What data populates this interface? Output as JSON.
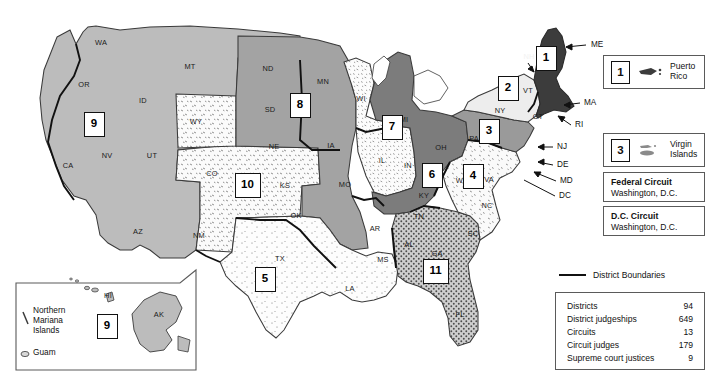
{
  "map": {
    "title": "United States Federal Judicial Circuits",
    "background_color": "#ffffff",
    "boundary_key": {
      "label": "District Boundaries",
      "line_color": "#111111"
    },
    "circuit_badges": [
      {
        "number": "1",
        "x": 546,
        "y": 58
      },
      {
        "number": "2",
        "x": 508,
        "y": 88
      },
      {
        "number": "3",
        "x": 489,
        "y": 131
      },
      {
        "number": "4",
        "x": 473,
        "y": 176
      },
      {
        "number": "5",
        "x": 265,
        "y": 279
      },
      {
        "number": "6",
        "x": 432,
        "y": 175
      },
      {
        "number": "7",
        "x": 392,
        "y": 127
      },
      {
        "number": "8",
        "x": 300,
        "y": 105
      },
      {
        "number": "9",
        "x": 94,
        "y": 124
      },
      {
        "number": "10",
        "x": 245,
        "y": 185
      },
      {
        "number": "11",
        "x": 433,
        "y": 271
      },
      {
        "number": "9",
        "x": 107,
        "y": 326
      }
    ],
    "state_labels": [
      {
        "abbr": "WA",
        "x": 101,
        "y": 43
      },
      {
        "abbr": "OR",
        "x": 84,
        "y": 85
      },
      {
        "abbr": "CA",
        "x": 68,
        "y": 166
      },
      {
        "abbr": "NV",
        "x": 107,
        "y": 156
      },
      {
        "abbr": "ID",
        "x": 143,
        "y": 101
      },
      {
        "abbr": "MT",
        "x": 190,
        "y": 67
      },
      {
        "abbr": "WY",
        "x": 196,
        "y": 122
      },
      {
        "abbr": "UT",
        "x": 152,
        "y": 156
      },
      {
        "abbr": "AZ",
        "x": 138,
        "y": 232
      },
      {
        "abbr": "CO",
        "x": 212,
        "y": 174
      },
      {
        "abbr": "NM",
        "x": 199,
        "y": 236
      },
      {
        "abbr": "ND",
        "x": 268,
        "y": 69
      },
      {
        "abbr": "SD",
        "x": 270,
        "y": 110
      },
      {
        "abbr": "NE",
        "x": 274,
        "y": 147
      },
      {
        "abbr": "KS",
        "x": 285,
        "y": 186
      },
      {
        "abbr": "OK",
        "x": 296,
        "y": 216
      },
      {
        "abbr": "TX",
        "x": 280,
        "y": 259
      },
      {
        "abbr": "MN",
        "x": 323,
        "y": 82
      },
      {
        "abbr": "IA",
        "x": 331,
        "y": 146
      },
      {
        "abbr": "MO",
        "x": 345,
        "y": 185
      },
      {
        "abbr": "AR",
        "x": 375,
        "y": 229
      },
      {
        "abbr": "LA",
        "x": 350,
        "y": 289
      },
      {
        "abbr": "MS",
        "x": 383,
        "y": 260
      },
      {
        "abbr": "WI",
        "x": 361,
        "y": 99
      },
      {
        "abbr": "IL",
        "x": 382,
        "y": 161
      },
      {
        "abbr": "IN",
        "x": 408,
        "y": 166
      },
      {
        "abbr": "MI",
        "x": 404,
        "y": 120
      },
      {
        "abbr": "OH",
        "x": 441,
        "y": 148
      },
      {
        "abbr": "KY",
        "x": 424,
        "y": 196
      },
      {
        "abbr": "TN",
        "x": 419,
        "y": 217
      },
      {
        "abbr": "AL",
        "x": 409,
        "y": 245
      },
      {
        "abbr": "GA",
        "x": 437,
        "y": 254
      },
      {
        "abbr": "FL",
        "x": 460,
        "y": 315
      },
      {
        "abbr": "SC",
        "x": 473,
        "y": 234
      },
      {
        "abbr": "NC",
        "x": 487,
        "y": 206
      },
      {
        "abbr": "VA",
        "x": 489,
        "y": 180
      },
      {
        "abbr": "WV",
        "x": 462,
        "y": 181
      },
      {
        "abbr": "PA",
        "x": 474,
        "y": 139
      },
      {
        "abbr": "NY",
        "x": 500,
        "y": 111
      },
      {
        "abbr": "VT",
        "x": 528,
        "y": 91
      },
      {
        "abbr": "NH",
        "x": 529,
        "y": 57
      },
      {
        "abbr": "CT",
        "x": 538,
        "y": 117
      }
    ],
    "pointer_labels": [
      {
        "abbr": "ME",
        "x": 591,
        "y": 45
      },
      {
        "abbr": "MA",
        "x": 584,
        "y": 103
      },
      {
        "abbr": "RI",
        "x": 575,
        "y": 125
      },
      {
        "abbr": "NJ",
        "x": 557,
        "y": 147
      },
      {
        "abbr": "DE",
        "x": 557,
        "y": 165
      },
      {
        "abbr": "MD",
        "x": 560,
        "y": 181
      },
      {
        "abbr": "DC",
        "x": 559,
        "y": 196
      }
    ],
    "circuit_fills": {
      "circuit_1": "#3c3c3c",
      "circuit_2": "#eaeaea",
      "circuit_3": "#9a9a9a",
      "circuit_4": "#f0f0f0",
      "circuit_5": "#f7f7f7",
      "circuit_6": "#7c7c7c",
      "circuit_7": "#ededed",
      "circuit_8": "#a3a3a3",
      "circuit_9": "#bcbcbc",
      "circuit_10": "#f4f4f4",
      "circuit_11": "#b0b0b0",
      "outline": "#3a3a3a"
    }
  },
  "inset": {
    "labels": [
      {
        "text": "HI",
        "x": 108,
        "y": 296
      },
      {
        "text": "AK",
        "x": 159,
        "y": 315
      }
    ],
    "territories": [
      {
        "name": "Northern\nMariana\nIslands",
        "x": 37,
        "y": 317
      },
      {
        "name": "Guam",
        "x": 37,
        "y": 355
      }
    ]
  },
  "territory_legends": [
    {
      "number": "1",
      "name": "Puerto\nRico",
      "icon": "puerto-rico-shape"
    },
    {
      "number": "3",
      "name": "Virgin\nIslands",
      "icon": "virgin-islands-shape"
    }
  ],
  "circuit_legends": [
    {
      "title": "Federal Circuit",
      "subtitle": "Washington, D.C."
    },
    {
      "title": "D.C. Circuit",
      "subtitle": "Washington, D.C."
    }
  ],
  "stats": {
    "rows": [
      {
        "label": "Districts",
        "value": "94"
      },
      {
        "label": "District judgeships",
        "value": "649"
      },
      {
        "label": "Circuits",
        "value": "13"
      },
      {
        "label": "Circuit judges",
        "value": "179"
      },
      {
        "label": "Supreme court justices",
        "value": "9"
      }
    ]
  }
}
